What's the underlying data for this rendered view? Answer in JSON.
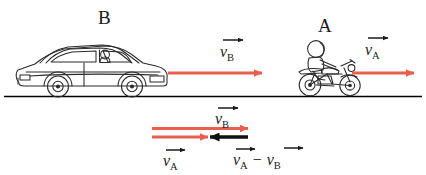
{
  "diagram": {
    "colors": {
      "vector_red": "#e8604c",
      "vector_black": "#111111",
      "ink": "#1a1a1a",
      "ground": "#000000"
    },
    "ground_line": {
      "label": "ground-line"
    },
    "vehicles": [
      {
        "id": "car-b",
        "label": "B",
        "icon": "car-icon",
        "description": "sedan car with driver facing right"
      },
      {
        "id": "motorcycle-a",
        "label": "A",
        "icon": "motorcycle-icon",
        "description": "rider on motorcycle facing right"
      }
    ],
    "top_vectors": [
      {
        "id": "v-b-top",
        "symbol": "v",
        "subscript": "B",
        "color": "#e8604c",
        "direction": "right",
        "owner": "car-b"
      },
      {
        "id": "v-a-top",
        "symbol": "v",
        "subscript": "A",
        "color": "#e8604c",
        "direction": "right",
        "owner": "motorcycle-a"
      }
    ],
    "bottom_vectors": [
      {
        "id": "v-b-bottom",
        "symbol": "v",
        "subscript": "B",
        "color": "#e8604c",
        "direction": "right",
        "position": "upper",
        "relative_length": "long"
      },
      {
        "id": "v-a-bottom",
        "symbol": "v",
        "subscript": "A",
        "color": "#e8604c",
        "direction": "right",
        "position": "lower",
        "relative_length": "short"
      },
      {
        "id": "v-a-minus-v-b",
        "symbol": "v",
        "subscript": "A",
        "operator": "−",
        "symbol2": "v",
        "subscript2": "B",
        "color": "#111111",
        "direction": "left",
        "position": "lower",
        "relative_length": "short"
      }
    ],
    "labels": {
      "v": "v",
      "sub_a": "A",
      "sub_b": "B",
      "minus": "−",
      "vehicle_b": "B",
      "vehicle_a": "A"
    }
  }
}
